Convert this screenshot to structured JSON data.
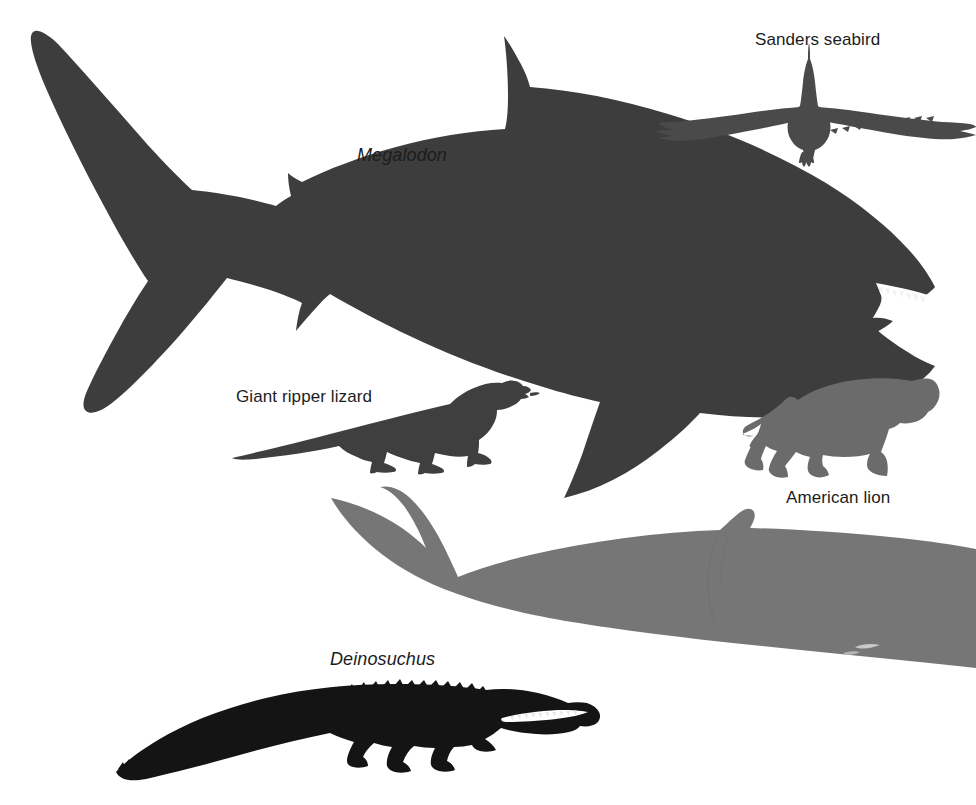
{
  "figure": {
    "type": "silhouette-size-comparison",
    "background_color": "#ffffff",
    "width": 976,
    "height": 805
  },
  "labels": {
    "megalodon": "Megalodon",
    "seabird": "Sanders seabird",
    "lizard": "Giant ripper lizard",
    "lion": "American lion",
    "deinosuchus": "Deinosuchus"
  },
  "silhouettes": [
    {
      "name": "megalodon",
      "label": "Megalodon",
      "label_style": "italic",
      "color": "#3d3d3d",
      "description": "giant shark seen in left-facing profile, occupying the upper two-thirds of the frame"
    },
    {
      "name": "sanders-seabird",
      "label": "Sanders seabird",
      "label_style": "roman",
      "color": "#4a4a4a",
      "description": "pelagornithid bird seen head-on in flight with outstretched serrated wings"
    },
    {
      "name": "giant-ripper-lizard",
      "label": "Giant ripper lizard",
      "label_style": "roman",
      "color": "#3f3f3f",
      "description": "large monitor lizard walking to the right with a long tapered tail"
    },
    {
      "name": "american-lion",
      "label": "American lion",
      "label_style": "roman",
      "color": "#6b6b6b",
      "description": "big cat walking to the right with a long curving tail"
    },
    {
      "name": "blue-whale",
      "label": "",
      "label_style": "none",
      "color": "#767676",
      "description": "unlabelled great whale, only the tail fluke and rear body visible, running off the right edge"
    },
    {
      "name": "deinosuchus",
      "label": "Deinosuchus",
      "label_style": "italic",
      "color": "#141414",
      "description": "giant crocodilian in right-facing profile with open toothed jaws and osteoderm-ridged back"
    }
  ],
  "colors": {
    "shark": "#3d3d3d",
    "bird": "#4a4a4a",
    "lizard": "#3f3f3f",
    "lion": "#6b6b6b",
    "whale": "#767676",
    "croc": "#141414",
    "text": "#1c1c1c",
    "background": "#ffffff",
    "teeth": "#f2f2f2"
  }
}
